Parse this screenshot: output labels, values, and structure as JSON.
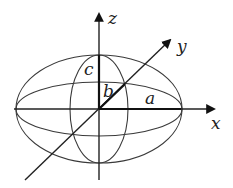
{
  "figure": {
    "axes": {
      "x": {
        "label": "x"
      },
      "y": {
        "label": "y"
      },
      "z": {
        "label": "z"
      }
    },
    "semi_axes": {
      "a": {
        "label": "a"
      },
      "b": {
        "label": "b"
      },
      "c": {
        "label": "c"
      }
    },
    "colors": {
      "stroke": "#3a3a3a",
      "axis": "#222222",
      "background": "#ffffff"
    }
  }
}
